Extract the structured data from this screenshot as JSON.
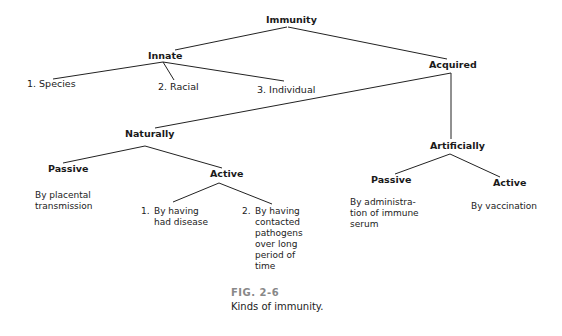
{
  "diagram": {
    "root": "Immunity",
    "innate": {
      "label": "Innate",
      "children": [
        "1. Species",
        "2. Racial",
        "3. Individual"
      ]
    },
    "acquired": {
      "label": "Acquired",
      "naturally": {
        "label": "Naturally",
        "passive": {
          "label": "Passive",
          "desc": [
            "By placental",
            "transmission"
          ]
        },
        "active": {
          "label": "Active",
          "items": [
            {
              "num": "1.",
              "lines": [
                "By having",
                "had disease"
              ]
            },
            {
              "num": "2.",
              "lines": [
                "By having",
                "contacted",
                "pathogens",
                "over long",
                "period of",
                "time"
              ]
            }
          ]
        }
      },
      "artificially": {
        "label": "Artificially",
        "passive": {
          "label": "Passive",
          "desc": [
            "By administra-",
            "tion of immune",
            "serum"
          ]
        },
        "active": {
          "label": "Active",
          "desc": [
            "By vaccination"
          ]
        }
      }
    }
  },
  "caption": {
    "fig": "FIG. 2-6",
    "text": "Kinds of immunity."
  }
}
